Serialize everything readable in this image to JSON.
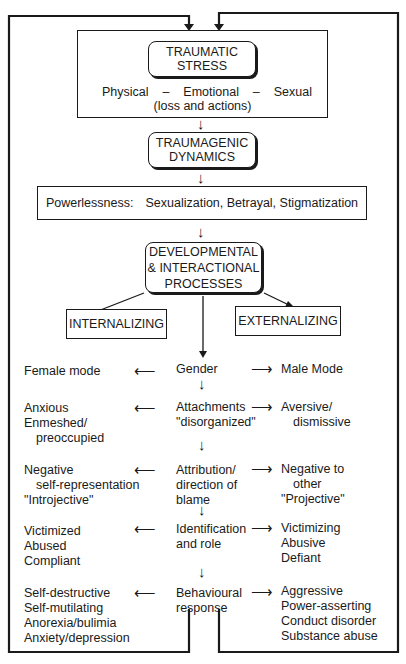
{
  "diagram": {
    "top_box": {
      "title_line1": "TRAUMATIC",
      "title_line2": "STRESS",
      "types": [
        "Physical",
        "–",
        "Emotional",
        "–",
        "Sexual"
      ],
      "subtitle": "(loss and actions)"
    },
    "dynamics_box": {
      "line1": "TRAUMAGENIC",
      "line2": "DYNAMICS"
    },
    "dynamics_list": {
      "label": "Powerlessness:",
      "items": "Sexualization, Betrayal, Stigmatization"
    },
    "processes_box": {
      "line1": "DEVELOPMENTAL",
      "line2": "& INTERACTIONAL",
      "line3": "PROCESSES"
    },
    "branches": {
      "left": "INTERNALIZING",
      "right": "EXTERNALIZING"
    },
    "rows": [
      {
        "center": [
          "Gender"
        ],
        "left": [
          "Female mode"
        ],
        "right": [
          "Male Mode"
        ]
      },
      {
        "center": [
          "Attachments",
          "\"disorganized\""
        ],
        "left": [
          "Anxious",
          "Enmeshed/",
          "preoccupied"
        ],
        "right": [
          "Aversive/",
          "dismissive"
        ]
      },
      {
        "center": [
          "Attribution/",
          "direction of",
          "blame"
        ],
        "left": [
          "Negative",
          "self-representation",
          "\"Introjective\""
        ],
        "right": [
          "Negative to",
          "other",
          "\"Projective\""
        ]
      },
      {
        "center": [
          "Identification",
          "and role"
        ],
        "left": [
          "Victimized",
          "Abused",
          "Compliant"
        ],
        "right": [
          "Victimizing",
          "Abusive",
          "Defiant"
        ]
      },
      {
        "center": [
          "Behavioural",
          "response"
        ],
        "left": [
          "Self-destructive",
          "Self-mutilating",
          "Anorexia/bulimia",
          "Anxiety/depression"
        ],
        "right": [
          "Aggressive",
          "Power-asserting",
          "Conduct disorder",
          "Substance abuse"
        ]
      }
    ],
    "glyphs": {
      "arrow_left": "⟵",
      "arrow_right": "⟶",
      "arrow_down": "↓"
    }
  }
}
